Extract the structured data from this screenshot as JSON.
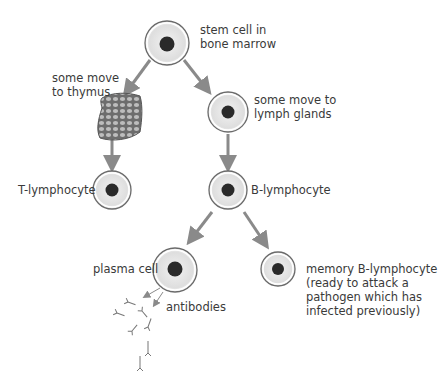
{
  "diagram": {
    "nodes": {
      "stem": {
        "label_lines": [
          "stem cell in",
          "bone marrow"
        ]
      },
      "thymus": {
        "label_lines": [
          "some move",
          "to thymus"
        ]
      },
      "lymph": {
        "label_lines": [
          "some move to",
          "lymph glands"
        ]
      },
      "t_lymph": {
        "label": "T-lymphocyte"
      },
      "b_lymph": {
        "label": "B-lymphocyte"
      },
      "plasma": {
        "label": "plasma cell"
      },
      "antibodies": {
        "label": "antibodies"
      },
      "memory": {
        "label_lines": [
          "memory B-lymphocyte",
          "(ready to attack a",
          "pathogen which has",
          "infected previously)"
        ]
      }
    },
    "colors": {
      "arrow": "#8a8a8a",
      "cell_outline": "#6a6a6a",
      "cell_fill": "#e9e9e9",
      "nucleus": "#2a2a2a",
      "text": "#3a3a3a"
    }
  }
}
